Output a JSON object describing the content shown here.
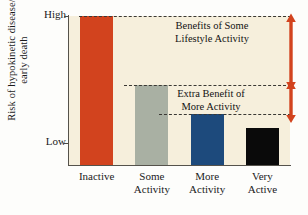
{
  "chart_data": {
    "type": "bar",
    "title": "",
    "subtitle": "",
    "xlabel": "",
    "ylabel": "Risk of hypokinetic disease/\nearly death",
    "categories": [
      "Inactive",
      "Some\nActivity",
      "More\nActivity",
      "Very\nActive"
    ],
    "values": [
      100,
      54,
      34,
      25
    ],
    "ylim": [
      0,
      100
    ],
    "ytick_labels": [
      "High",
      "Low"
    ],
    "ytick_values": [
      100,
      4
    ],
    "grid": false,
    "legend": "none",
    "bar_colors": [
      "#d2431e",
      "#a9b0a3",
      "#1d4a7c",
      "#0a0a0a"
    ],
    "plot_background": "#f6efdc",
    "axis_color": "#55524b",
    "annotations": [
      {
        "id": "benefits",
        "text": "Benefits of Some\nLifestyle Activity",
        "from_value": 100,
        "to_value": 54
      },
      {
        "id": "extra",
        "text": "Extra Benefit of\nMore Activity",
        "from_value": 54,
        "to_value": 34
      }
    ],
    "guide_lines": [
      {
        "id": "top",
        "value": 100
      },
      {
        "id": "some-activity-top",
        "value": 54
      },
      {
        "id": "more-activity-top",
        "value": 34
      }
    ],
    "arrow_color": "#d2431e",
    "dash_color": "#3a3833"
  },
  "axis": {
    "y_label": "Risk of hypokinetic disease/\nearly death",
    "y_high": "High",
    "y_low": "Low"
  },
  "bars": [
    {
      "name": "inactive",
      "label": "Inactive",
      "color": "#d2431e",
      "height_pct": 100
    },
    {
      "name": "some-activity",
      "label": "Some\nActivity",
      "color": "#a9b0a3",
      "height_pct": 54
    },
    {
      "name": "more-activity",
      "label": "More\nActivity",
      "color": "#1d4a7c",
      "height_pct": 34
    },
    {
      "name": "very-active",
      "label": "Very\nActive",
      "color": "#0a0a0a",
      "height_pct": 25
    }
  ],
  "annotations": {
    "benefits": "Benefits of Some\nLifestyle Activity",
    "extra": "Extra Benefit of\nMore Activity"
  }
}
